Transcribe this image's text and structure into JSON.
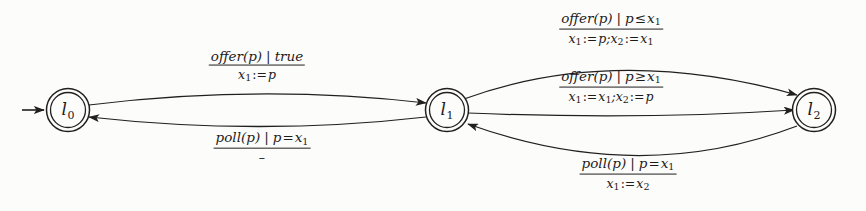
{
  "diagram": {
    "type": "finite-state-automaton",
    "title": "",
    "background_color": "#fcfcfb",
    "stroke_color": "#22201f",
    "states": [
      {
        "id": "l0",
        "label": "l",
        "subscript": "0",
        "x": 68,
        "y": 110,
        "accepting": true,
        "initial": true
      },
      {
        "id": "l1",
        "label": "l",
        "subscript": "1",
        "x": 447,
        "y": 110,
        "accepting": true,
        "initial": false
      },
      {
        "id": "l2",
        "label": "l",
        "subscript": "2",
        "x": 814,
        "y": 110,
        "accepting": true,
        "initial": false
      }
    ],
    "transitions": [
      {
        "id": "t-l0-l1",
        "from": "l0",
        "to": "l1",
        "action": "offer(p)",
        "guard": "true",
        "guard_op": "",
        "guard_rhs": "",
        "assignment": "x1:=p",
        "label_x": 257,
        "label_y": 66
      },
      {
        "id": "t-l1-l0",
        "from": "l1",
        "to": "l0",
        "action": "poll(p)",
        "guard": "p=x1",
        "guard_op": "=",
        "guard_rhs": "x1",
        "assignment": "",
        "label_x": 262,
        "label_y": 147
      },
      {
        "id": "t-l1-l2-upper",
        "from": "l1",
        "to": "l2",
        "action": "offer(p)",
        "guard": "p<=x1",
        "guard_op": "≤",
        "guard_rhs": "x1",
        "assignment": "x1:=p;x2:=x1",
        "label_x": 611,
        "label_y": 29
      },
      {
        "id": "t-l1-l2-middle",
        "from": "l1",
        "to": "l2",
        "action": "offer(p)",
        "guard": "p>=x1",
        "guard_op": "≥",
        "guard_rhs": "x1",
        "assignment": "x1:=x1;x2:=p",
        "label_x": 611,
        "label_y": 87
      },
      {
        "id": "t-l2-l1",
        "from": "l2",
        "to": "l1",
        "action": "poll(p)",
        "guard": "p=x1",
        "guard_op": "=",
        "guard_rhs": "x1",
        "assignment": "x1:=x2",
        "label_x": 628,
        "label_y": 174
      }
    ],
    "symbols": {
      "empty_assignment": "–",
      "guard_separator": "|",
      "assign_operator": ":="
    }
  }
}
